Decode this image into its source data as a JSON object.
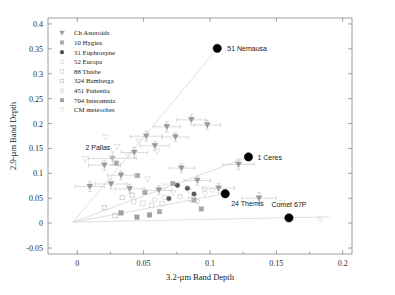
{
  "chart_data": {
    "type": "scatter",
    "title": "",
    "xlabel": "3.2-µm Band Depth",
    "ylabel": "2.9-µm Band Depth",
    "xlim": [
      -0.022,
      0.207
    ],
    "ylim": [
      -0.062,
      0.412
    ],
    "xticks": [
      0,
      0.05,
      0.1,
      0.15,
      0.2
    ],
    "xticklabels": [
      "0",
      "0.05",
      "0.1",
      "0.15",
      "0.2"
    ],
    "yticks": [
      -0.05,
      0,
      0.05,
      0.1,
      0.15,
      0.2,
      0.25,
      0.3,
      0.35,
      0.4
    ],
    "yticklabels": [
      "-0.05",
      "0",
      "0.05",
      "0.1",
      "0.15",
      "0.2",
      "0.25",
      "0.3",
      "0.35",
      "0.4"
    ],
    "grid": false,
    "legend_position": "upper-left",
    "series": [
      {
        "name": "Ch Asteroids",
        "marker": "triangle-down",
        "color": "#9a9a9a",
        "filled": true,
        "points": [
          {
            "x": 0.0095,
            "y": 0.0735,
            "xerr": 0.011,
            "yerr": 0.01
          },
          {
            "x": 0.0205,
            "y": 0.1165,
            "xerr": 0.012,
            "yerr": 0.01
          },
          {
            "x": 0.0255,
            "y": 0.0785,
            "xerr": 0.012,
            "yerr": 0.01
          },
          {
            "x": 0.033,
            "y": 0.096,
            "xerr": 0.01,
            "yerr": 0.009
          },
          {
            "x": 0.0395,
            "y": 0.069,
            "xerr": 0.011,
            "yerr": 0.009
          },
          {
            "x": 0.043,
            "y": 0.142,
            "xerr": 0.01,
            "yerr": 0.01
          },
          {
            "x": 0.052,
            "y": 0.1745,
            "xerr": 0.012,
            "yerr": 0.01
          },
          {
            "x": 0.0585,
            "y": 0.1555,
            "xerr": 0.011,
            "yerr": 0.009
          },
          {
            "x": 0.0615,
            "y": 0.066,
            "xerr": 0.01,
            "yerr": 0.009
          },
          {
            "x": 0.0675,
            "y": 0.1935,
            "xerr": 0.01,
            "yerr": 0.01
          },
          {
            "x": 0.074,
            "y": 0.173,
            "xerr": 0.01,
            "yerr": 0.009
          },
          {
            "x": 0.0785,
            "y": 0.1105,
            "xerr": 0.01,
            "yerr": 0.009
          },
          {
            "x": 0.086,
            "y": 0.2075,
            "xerr": 0.011,
            "yerr": 0.01
          },
          {
            "x": 0.0905,
            "y": 0.0855,
            "xerr": 0.01,
            "yerr": 0.009
          },
          {
            "x": 0.098,
            "y": 0.197,
            "xerr": 0.01,
            "yerr": 0.009
          },
          {
            "x": 0.1065,
            "y": 0.07,
            "xerr": 0.012,
            "yerr": 0.01
          },
          {
            "x": 0.1215,
            "y": 0.118,
            "xerr": 0.012,
            "yerr": 0.011
          },
          {
            "x": 0.137,
            "y": 0.05,
            "xerr": 0.013,
            "yerr": 0.011
          }
        ]
      },
      {
        "name": "CM meteorites",
        "marker": "triangle-down",
        "color": "#d9d9d9",
        "filled": false,
        "points": [
          {
            "x": 0.006,
            "y": 0.129
          },
          {
            "x": 0.0215,
            "y": 0.172
          },
          {
            "x": 0.03,
            "y": 0.153
          },
          {
            "x": 0.0385,
            "y": 0.136
          },
          {
            "x": 0.0465,
            "y": 0.164
          },
          {
            "x": 0.053,
            "y": 0.088
          },
          {
            "x": 0.06,
            "y": 0.144
          },
          {
            "x": 0.0665,
            "y": 0.0735
          },
          {
            "x": 0.072,
            "y": 0.061
          },
          {
            "x": 0.084,
            "y": 0.064
          },
          {
            "x": 0.096,
            "y": 0.0585
          },
          {
            "x": 0.1545,
            "y": 0.041
          },
          {
            "x": 0.183,
            "y": 0.0075
          }
        ]
      },
      {
        "name": "10 Hygiea",
        "marker": "square",
        "color": "#a8a8a8",
        "filled": true,
        "points": [
          {
            "x": 0.0295,
            "y": 0.1205
          },
          {
            "x": 0.0455,
            "y": 0.0955
          },
          {
            "x": 0.051,
            "y": 0.0615
          },
          {
            "x": 0.072,
            "y": 0.0795
          },
          {
            "x": 0.088,
            "y": 0.0465
          },
          {
            "x": 0.062,
            "y": 0.023
          },
          {
            "x": 0.0935,
            "y": 0.0285
          }
        ]
      },
      {
        "name": "31 Euphrosyne",
        "marker": "circle",
        "color": "#5a5a5a",
        "filled": true,
        "points": [
          {
            "x": 0.0755,
            "y": 0.076
          },
          {
            "x": 0.083,
            "y": 0.07
          },
          {
            "x": 0.088,
            "y": 0.0585
          },
          {
            "x": 0.069,
            "y": 0.0495
          }
        ]
      },
      {
        "name": "52 Europa",
        "marker": "circle",
        "color": "#cfcfcf",
        "filled": false,
        "points": [
          {
            "x": 0.0585,
            "y": 0.047
          },
          {
            "x": 0.0655,
            "y": 0.052
          },
          {
            "x": 0.096,
            "y": 0.069
          },
          {
            "x": 0.102,
            "y": 0.0665
          }
        ]
      },
      {
        "name": "88 Thisbe",
        "marker": "square",
        "color": "#d0d0d0",
        "filled": false,
        "points": [
          {
            "x": 0.0425,
            "y": 0.043
          },
          {
            "x": 0.0495,
            "y": 0.04
          },
          {
            "x": 0.056,
            "y": 0.0355
          },
          {
            "x": 0.064,
            "y": 0.039
          }
        ]
      },
      {
        "name": "324 Bamberga",
        "marker": "square",
        "color": "#bfbfbf",
        "filled": false,
        "points": [
          {
            "x": 0.034,
            "y": 0.0515
          },
          {
            "x": 0.0415,
            "y": 0.056
          },
          {
            "x": 0.0205,
            "y": 0.031
          },
          {
            "x": 0.0285,
            "y": 0.0155
          }
        ]
      },
      {
        "name": "451 Patientia",
        "marker": "circle",
        "color": "#c4c4c4",
        "filled": false,
        "points": [
          {
            "x": 0.0775,
            "y": 0.053
          },
          {
            "x": 0.085,
            "y": 0.048
          },
          {
            "x": 0.0905,
            "y": 0.0435
          }
        ]
      },
      {
        "name": "704 Interamnia",
        "marker": "square",
        "color": "#9e9e9e",
        "filled": true,
        "points": [
          {
            "x": 0.033,
            "y": 0.0205
          },
          {
            "x": 0.045,
            "y": 0.012
          },
          {
            "x": 0.0545,
            "y": 0.0165
          }
        ]
      }
    ],
    "highlighted_points": [
      {
        "label": "51 Nemausa",
        "x": 0.1055,
        "y": 0.351,
        "label_dx": 10,
        "label_dy": 3
      },
      {
        "label": "1 Ceres",
        "x": 0.129,
        "y": 0.133,
        "label_dx": 9,
        "label_dy": 3
      },
      {
        "label": "24 Themis",
        "x": 0.1115,
        "y": 0.059,
        "label_dx": 6,
        "label_dy": 12
      },
      {
        "label": "2 Pallas",
        "x": 0.0265,
        "y": 0.13,
        "label_dx": -2,
        "label_dy": -8,
        "xerr": 0.018,
        "yerr": 0.013,
        "faint": true
      },
      {
        "label": "Comet 67P",
        "x": 0.1595,
        "y": 0.0105,
        "label_dx": 0,
        "label_dy": -11
      }
    ],
    "trendlines": [
      {
        "x1": -0.003,
        "y1": 0.002,
        "x2": 0.1055,
        "y2": 0.351
      },
      {
        "x1": -0.003,
        "y1": 0.002,
        "x2": 0.129,
        "y2": 0.133
      },
      {
        "x1": -0.003,
        "y1": 0.002,
        "x2": 0.1115,
        "y2": 0.059
      },
      {
        "x1": -0.003,
        "y1": 0.002,
        "x2": 0.19,
        "y2": 0.0125
      }
    ]
  },
  "legend": {
    "entries": [
      {
        "label": "Ch Asteroids",
        "marker": "triangle-down",
        "color": "#9a9a9a",
        "filled": true
      },
      {
        "label": "10 Hygiea",
        "marker": "square",
        "color": "#a8a8a8",
        "filled": true
      },
      {
        "label": "31 Euphrosyne",
        "marker": "circle",
        "color": "#4a4a4a",
        "filled": true
      },
      {
        "label": "52 Europa",
        "marker": "circle",
        "color": "#cfcfcf",
        "filled": false
      },
      {
        "label": "88 Thisbe",
        "marker": "square",
        "color": "#d0d0d0",
        "filled": false
      },
      {
        "label": "324 Bamberga",
        "marker": "square",
        "color": "#bfbfbf",
        "filled": false
      },
      {
        "label": "451 Patientia",
        "marker": "circle",
        "color": "#c4c4c4",
        "filled": false
      },
      {
        "label": "704 Interamnia",
        "marker": "square",
        "color": "#9e9e9e",
        "filled": true
      },
      {
        "label": "CM meteorites",
        "marker": "triangle-down",
        "color": "#d9d9d9",
        "filled": false
      }
    ]
  },
  "colors": {
    "axis": "#8a8a8a",
    "text": "#1a1a1a",
    "highlight": "#000000",
    "trendline": "#c9c9c9"
  }
}
